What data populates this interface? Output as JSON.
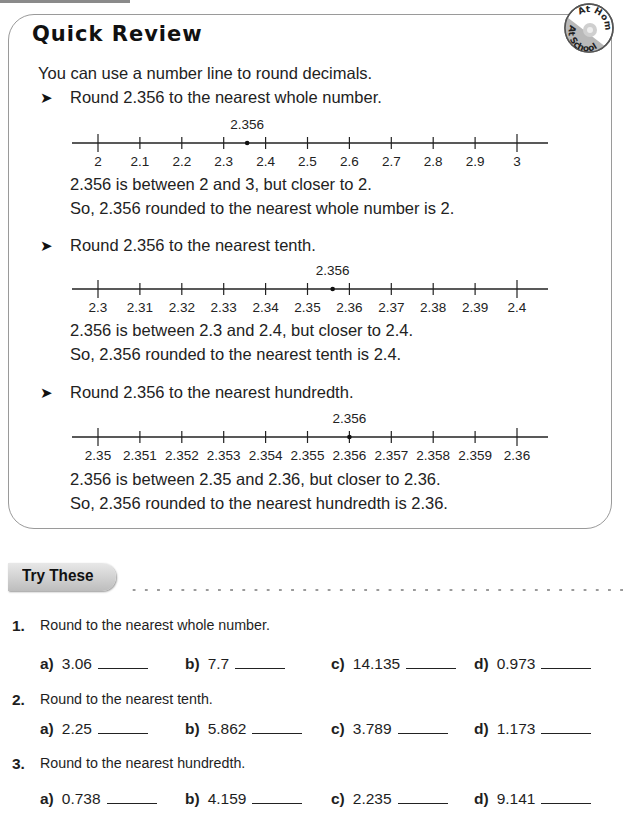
{
  "quick_review": {
    "title": "Quick Review",
    "badge": {
      "top": "At Home",
      "bottom": "At School"
    },
    "intro": "You can use a number line to round decimals.",
    "examples": [
      {
        "prompt": "Round 2.356 to the nearest whole number.",
        "marker_label": "2.356",
        "marker_value": 2.356,
        "ticks": [
          "2",
          "2.1",
          "2.2",
          "2.3",
          "2.4",
          "2.5",
          "2.6",
          "2.7",
          "2.8",
          "2.9",
          "3"
        ],
        "range": [
          2,
          3
        ],
        "line1": "2.356 is between 2 and 3, but closer to 2.",
        "line2": "So, 2.356 rounded to the nearest whole number is 2."
      },
      {
        "prompt": "Round 2.356 to the nearest tenth.",
        "marker_label": "2.356",
        "marker_value": 2.356,
        "ticks": [
          "2.3",
          "2.31",
          "2.32",
          "2.33",
          "2.34",
          "2.35",
          "2.36",
          "2.37",
          "2.38",
          "2.39",
          "2.4"
        ],
        "range": [
          2.3,
          2.4
        ],
        "line1": "2.356 is between 2.3 and 2.4, but closer to 2.4.",
        "line2": "So, 2.356 rounded to the nearest tenth is 2.4."
      },
      {
        "prompt": "Round 2.356 to the nearest hundredth.",
        "marker_label": "2.356",
        "marker_value": 2.356,
        "ticks": [
          "2.35",
          "2.351",
          "2.352",
          "2.353",
          "2.354",
          "2.355",
          "2.356",
          "2.357",
          "2.358",
          "2.359",
          "2.36"
        ],
        "range": [
          2.35,
          2.36
        ],
        "line1": "2.356 is between 2.35 and 2.36, but closer to 2.36.",
        "line2": "So, 2.356 rounded to the nearest hundredth is 2.36."
      }
    ]
  },
  "try_these": {
    "heading": "Try These",
    "questions": [
      {
        "number": "1.",
        "prompt": "Round to the nearest whole number.",
        "items": [
          {
            "letter": "a)",
            "value": "3.06"
          },
          {
            "letter": "b)",
            "value": "7.7"
          },
          {
            "letter": "c)",
            "value": "14.135"
          },
          {
            "letter": "d)",
            "value": "0.973"
          }
        ]
      },
      {
        "number": "2.",
        "prompt": "Round to the nearest tenth.",
        "items": [
          {
            "letter": "a)",
            "value": "2.25"
          },
          {
            "letter": "b)",
            "value": "5.862"
          },
          {
            "letter": "c)",
            "value": "3.789"
          },
          {
            "letter": "d)",
            "value": "1.173"
          }
        ]
      },
      {
        "number": "3.",
        "prompt": "Round to the nearest hundredth.",
        "items": [
          {
            "letter": "a)",
            "value": "0.738"
          },
          {
            "letter": "b)",
            "value": "4.159"
          },
          {
            "letter": "c)",
            "value": "2.235"
          },
          {
            "letter": "d)",
            "value": "9.141"
          }
        ]
      }
    ]
  }
}
